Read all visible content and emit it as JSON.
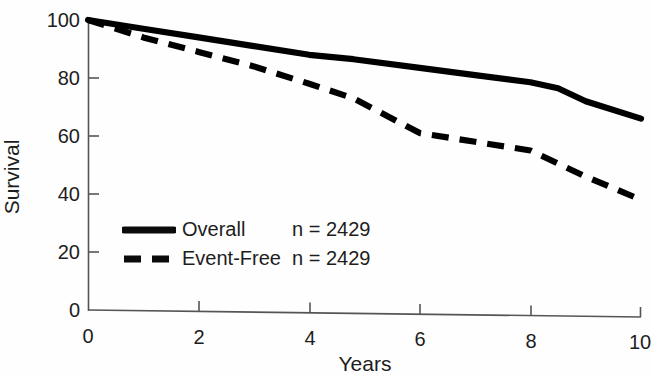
{
  "chart_data": {
    "type": "line",
    "title": "",
    "subtitle": "",
    "xlabel": "Years",
    "ylabel": "Survival",
    "xlim": [
      0,
      10
    ],
    "ylim": [
      0,
      100
    ],
    "xticks": [
      "0",
      "2",
      "4",
      "6",
      "8",
      "10"
    ],
    "xtick_values": [
      0,
      2,
      4,
      6,
      8,
      10
    ],
    "yticks": [
      "0",
      "20",
      "40",
      "60",
      "80",
      "100"
    ],
    "ytick_values": [
      0,
      20,
      40,
      60,
      80,
      100
    ],
    "grid": false,
    "legend_position": "inside-lower-left",
    "series": [
      {
        "name": "Overall",
        "n_label": "n = 2429",
        "n": 2429,
        "style": "solid",
        "color": "#000000",
        "x": [
          0,
          1,
          2,
          3,
          4,
          4.8,
          6,
          7,
          8,
          8.5,
          9,
          10
        ],
        "values": [
          100,
          97,
          94,
          91,
          88,
          86.5,
          83.5,
          81,
          78.5,
          76.5,
          72,
          66
        ]
      },
      {
        "name": "Event-Free",
        "n_label": "n = 2429",
        "n": 2429,
        "style": "dashed",
        "color": "#000000",
        "x": [
          0,
          1,
          2,
          3,
          4,
          4.8,
          6,
          7,
          8,
          9,
          10
        ],
        "values": [
          100,
          94,
          89,
          84,
          78,
          73,
          61,
          58,
          55,
          46,
          38
        ]
      }
    ]
  },
  "axes": {
    "y_title": "Survival",
    "x_title": "Years",
    "y_tick_labels": [
      "100",
      "80",
      "60",
      "40",
      "20",
      "0"
    ],
    "x_tick_labels": [
      "0",
      "2",
      "4",
      "6",
      "8",
      "10"
    ]
  },
  "legend": {
    "rows": [
      {
        "label": "Overall",
        "n": "n = 2429"
      },
      {
        "label": "Event-Free",
        "n": "n = 2429"
      }
    ]
  }
}
